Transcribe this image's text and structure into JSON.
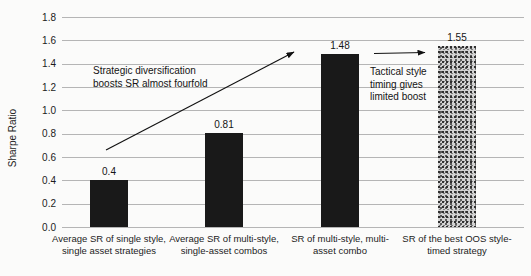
{
  "chart_data": {
    "type": "bar",
    "title": "",
    "xlabel": "",
    "ylabel": "Sharpe Ratio",
    "ylim": [
      0,
      1.8
    ],
    "y_tick_step": 0.2,
    "y_ticks": [
      "1.8",
      "1.6",
      "1.4",
      "1.2",
      "1.0",
      "0.8",
      "0.6",
      "0.4",
      "0.2",
      "0.0"
    ],
    "grid": "horizontal gridlines on, no axis frame",
    "legend": "none",
    "categories": [
      "Average SR of single style, single asset strategies",
      "Average SR of multi-style, single-asset combos",
      "SR of multi-style, multi-asset combo",
      "SR of the best OOS style-timed strategy"
    ],
    "categories_lines": [
      [
        "Average SR of single style,",
        "single asset strategies"
      ],
      [
        "Average SR of multi-style,",
        "single-asset combos"
      ],
      [
        "SR of multi-style, multi-",
        "asset combo"
      ],
      [
        "SR of the best OOS style-",
        "timed strategy"
      ]
    ],
    "values": [
      0.4,
      0.81,
      1.48,
      1.55
    ],
    "value_labels": [
      "0.4",
      "0.81",
      "1.48",
      "1.55"
    ],
    "bar_styles": [
      "solid",
      "solid",
      "solid",
      "speckle-pattern"
    ],
    "annotations": [
      {
        "text": "Strategic diversification\nboosts SR almost fourfold",
        "arrow": "diagonal arrow pointing to top of third bar"
      },
      {
        "text": "Tactical style\ntiming gives\nlimited boost",
        "arrow": "horizontal arrow pointing to top of fourth bar"
      }
    ],
    "colors": {
      "bar_solid": "#191919",
      "bar_pattern_average": "#9a9a9a",
      "gridline": "#b5b5b5",
      "text": "#1c1c1c",
      "background": "#fbfbfa"
    }
  }
}
